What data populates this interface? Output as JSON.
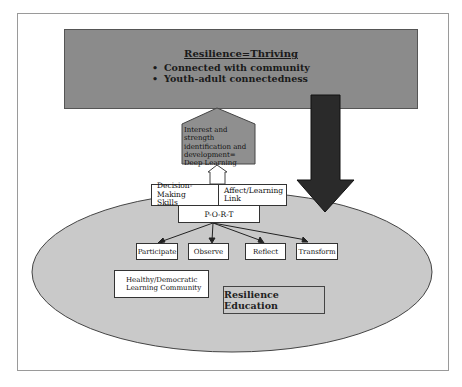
{
  "diagram": {
    "top_box": {
      "title": "Resilience=Thriving",
      "bullets": [
        "Connected with community",
        "Youth-adult connectedness"
      ]
    },
    "pentagon": {
      "lines": [
        "Interest and strength",
        "identification and",
        "development=",
        "Deep Learning"
      ]
    },
    "skills_box": {
      "left": [
        "Decision-Making",
        "Skills"
      ],
      "right": [
        "Affect/Learning",
        "Link"
      ]
    },
    "port": "P-O-R-T",
    "steps": [
      "Participate",
      "Observe",
      "Reflect",
      "Transform"
    ],
    "community_box": [
      "Healthy/Democratic",
      "Learning Community"
    ],
    "ellipse_label": "Resilience Education",
    "colors": {
      "top_box_fill": "#8b8b8b",
      "pentagon_fill": "#8f8f8f",
      "ellipse_fill": "#c9c9c9",
      "down_arrow": "#2a2a2a",
      "frame": "#9a9a9a"
    }
  }
}
